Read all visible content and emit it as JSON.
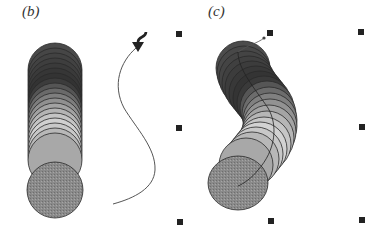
{
  "panels": [
    {
      "id": "b",
      "label": "(b)",
      "description": "straight stack of overlapping circles with gradient shading and separate S-shaped path with arrow"
    },
    {
      "id": "c",
      "label": "(c)",
      "description": "circles stack bent along path, with selection handles"
    }
  ],
  "colors": {
    "background": "#ffffff",
    "dark_shade": "#3a3a3a",
    "mid_shade": "#7a7a7a",
    "light_shade": "#d0d0d0",
    "end_cap": "#8c8c8c",
    "outline": "#2a2a2a",
    "path": "#555555",
    "handle": "#222222"
  },
  "selection_handles": [
    {
      "name": "top-left",
      "x": 176,
      "y": 31
    },
    {
      "name": "top-middle",
      "x": 267,
      "y": 30
    },
    {
      "name": "top-right",
      "x": 358,
      "y": 29
    },
    {
      "name": "middle-left",
      "x": 176,
      "y": 125
    },
    {
      "name": "middle-right",
      "x": 359,
      "y": 124
    },
    {
      "name": "bottom-left",
      "x": 177,
      "y": 219
    },
    {
      "name": "bottom-middle",
      "x": 268,
      "y": 218
    },
    {
      "name": "bottom-right",
      "x": 359,
      "y": 217
    }
  ]
}
